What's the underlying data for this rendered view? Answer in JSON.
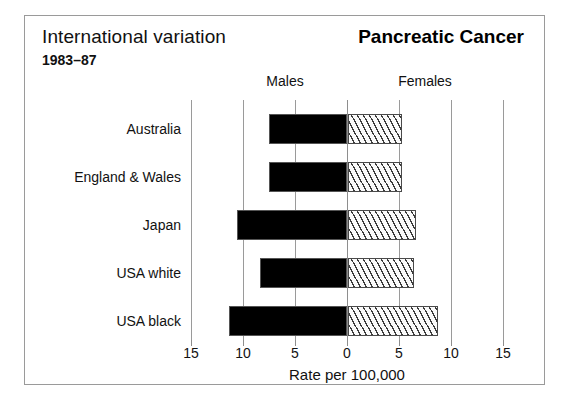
{
  "header": {
    "left_title": "International variation",
    "period": "1983–87",
    "right_title": "Pancreatic Cancer"
  },
  "groups": {
    "left_label": "Males",
    "right_label": "Females"
  },
  "axis": {
    "title": "Rate per 100,000",
    "tick_labels": [
      "15",
      "10",
      "5",
      "0",
      "5",
      "10",
      "15"
    ],
    "tick_values": [
      -15,
      -10,
      -5,
      0,
      5,
      10,
      15
    ]
  },
  "colors": {
    "male_bar": "#000000",
    "female_bar_hatch": "#3b3b3b",
    "female_bar_fill": "#fbfbfb",
    "gridline": "#9a9a9a",
    "frame": "#9a9a9a",
    "text": "#111111"
  },
  "chart_data": {
    "type": "bar",
    "orientation": "horizontal-diverging",
    "title": "Pancreatic Cancer",
    "subtitle": "International variation 1983–87",
    "xlabel": "Rate per 100,000",
    "ylabel": "",
    "categories": [
      "Australia",
      "England & Wales",
      "Japan",
      "USA white",
      "USA black"
    ],
    "series": [
      {
        "name": "Males",
        "direction": "left",
        "values": [
          7.5,
          7.5,
          10.6,
          8.4,
          11.3
        ]
      },
      {
        "name": "Females",
        "direction": "right",
        "values": [
          5.2,
          5.2,
          6.5,
          6.3,
          8.7
        ]
      }
    ],
    "xlim": [
      -15,
      15
    ],
    "xticks": [
      -15,
      -10,
      -5,
      0,
      5,
      10,
      15
    ],
    "xticklabels": [
      "15",
      "10",
      "5",
      "0",
      "5",
      "10",
      "15"
    ],
    "grid": true,
    "legend": "above-panels"
  }
}
